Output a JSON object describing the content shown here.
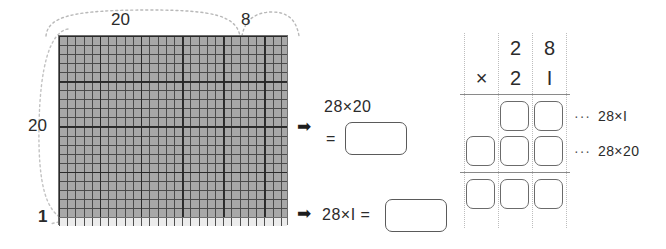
{
  "area_model": {
    "top_brace_labels": {
      "left_span": "20",
      "right_span": "8"
    },
    "left_brace_labels": {
      "upper_span": "20",
      "lower_span": "1"
    },
    "grid": {
      "total_columns": "28",
      "total_rows": "21",
      "shaded_rows": "20",
      "unshaded_rows": "1",
      "shaded_color": "#a8a8a8",
      "unshaded_color": "#ececec",
      "minor_line_color": "#464646",
      "major_line_color": "#282828",
      "major_line_interval": "5"
    }
  },
  "equations": {
    "arrow_icon": "➡",
    "top": {
      "expression": "28×20",
      "equals_sign": "=",
      "answer_value": ""
    },
    "bottom": {
      "expression": "28×I =",
      "answer_value": ""
    }
  },
  "vertical_multiplication": {
    "multiplicand": {
      "tens": "2",
      "ones": "8"
    },
    "operator": "×",
    "multiplier": {
      "tens": "2",
      "ones": "I"
    },
    "partial_rows": [
      {
        "boxes": [
          "",
          ""
        ],
        "leader": "···",
        "note": "28×I"
      },
      {
        "boxes": [
          "",
          "",
          ""
        ],
        "leader": "···",
        "note": "28×20"
      },
      {
        "boxes": [
          "",
          "",
          ""
        ],
        "leader": "",
        "note": ""
      }
    ]
  }
}
